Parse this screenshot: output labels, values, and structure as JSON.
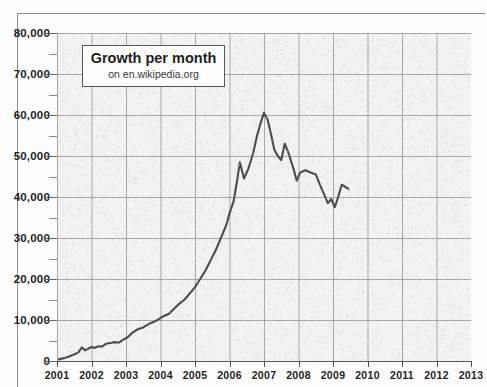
{
  "chart_data": {
    "type": "line",
    "title": "Growth per month",
    "subtitle": "on en.wikipedia.org",
    "xlabel": "",
    "ylabel": "",
    "xlim": [
      2001,
      2013
    ],
    "ylim": [
      0,
      80000
    ],
    "grid": true,
    "legend": "none",
    "x_ticks": [
      "2001",
      "2002",
      "2003",
      "2004",
      "2005",
      "2006",
      "2007",
      "2008",
      "2009",
      "2010",
      "2011",
      "2012",
      "2013"
    ],
    "y_ticks": [
      "0",
      "10,000",
      "20,000",
      "30,000",
      "40,000",
      "50,000",
      "60,000",
      "70,000",
      "80,000"
    ],
    "y_tick_values": [
      0,
      10000,
      20000,
      30000,
      40000,
      50000,
      60000,
      70000,
      80000
    ],
    "y_minor_step": 5000,
    "series": [
      {
        "name": "Growth per month",
        "color": "#4a4a4a",
        "x": [
          2001.05,
          2001.2,
          2001.35,
          2001.5,
          2001.62,
          2001.72,
          2001.82,
          2001.9,
          2002.0,
          2002.1,
          2002.2,
          2002.3,
          2002.42,
          2002.55,
          2002.68,
          2002.8,
          2002.92,
          2003.05,
          2003.2,
          2003.35,
          2003.5,
          2003.65,
          2003.8,
          2003.95,
          2004.1,
          2004.25,
          2004.4,
          2004.55,
          2004.7,
          2004.85,
          2005.0,
          2005.15,
          2005.3,
          2005.45,
          2005.6,
          2005.75,
          2005.9,
          2006.0,
          2006.12,
          2006.22,
          2006.3,
          2006.42,
          2006.55,
          2006.68,
          2006.8,
          2006.9,
          2007.0,
          2007.1,
          2007.2,
          2007.3,
          2007.4,
          2007.5,
          2007.6,
          2007.72,
          2007.85,
          2007.95,
          2008.05,
          2008.2,
          2008.35,
          2008.5,
          2008.62,
          2008.75,
          2008.85,
          2008.95,
          2009.05,
          2009.15,
          2009.25,
          2009.35,
          2009.45
        ],
        "y": [
          400,
          700,
          1100,
          1600,
          2100,
          3300,
          2600,
          3000,
          3400,
          3200,
          3600,
          3500,
          4200,
          4400,
          4600,
          4500,
          5200,
          5800,
          7000,
          7800,
          8200,
          9000,
          9500,
          10200,
          11000,
          11500,
          12800,
          14000,
          15000,
          16500,
          18000,
          20000,
          22000,
          24500,
          27000,
          30000,
          33000,
          36000,
          39000,
          44000,
          48500,
          44500,
          47000,
          50500,
          55000,
          58000,
          60500,
          59000,
          55500,
          51500,
          50000,
          49000,
          53000,
          50500,
          47000,
          44000,
          46000,
          46500,
          46000,
          45500,
          43000,
          40500,
          38500,
          39500,
          37500,
          40000,
          43000,
          42500,
          42000
        ]
      }
    ]
  },
  "axes": {
    "y_label_0": "0",
    "y_label_1": "10,000",
    "y_label_2": "20,000",
    "y_label_3": "30,000",
    "y_label_4": "40,000",
    "y_label_5": "50,000",
    "y_label_6": "60,000",
    "y_label_7": "70,000",
    "y_label_8": "80,000"
  },
  "colors": {
    "line": "#4a4a4a",
    "grid": "#9a9a9a",
    "plot_background": "#f1f1f1",
    "page_background": "#fdfdfd",
    "text": "#232323"
  }
}
